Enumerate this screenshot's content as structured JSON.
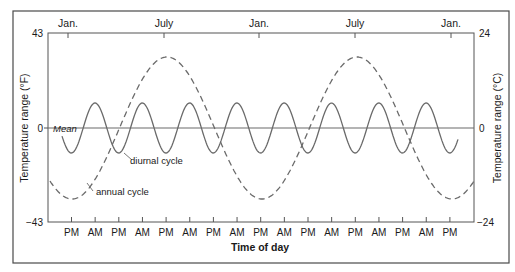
{
  "chart_data": {
    "type": "line",
    "title": "",
    "xlabel": "Time of day",
    "ylabel_left": "Temperature range (°F)",
    "ylabel_right": "Temperature range (°C)",
    "ylim_left": [
      -43,
      43
    ],
    "ylim_right": [
      -24,
      24
    ],
    "yticks_left": [
      "43",
      "0",
      "-43"
    ],
    "yticks_right": [
      "24",
      "0",
      "-24"
    ],
    "top_axis_ticks": [
      "Jan.",
      "July",
      "Jan.",
      "July",
      "Jan."
    ],
    "bottom_axis_ticks": [
      "PM",
      "AM",
      "PM",
      "AM",
      "PM",
      "AM",
      "PM",
      "AM",
      "PM",
      "AM",
      "PM",
      "AM",
      "PM",
      "AM",
      "PM",
      "AM",
      "PM"
    ],
    "mean_label": "Mean",
    "grid": false,
    "legend": "inline annotations",
    "series": [
      {
        "name": "diurnal cycle",
        "style": "solid",
        "description": "Sinusoid about the mean with period of one day (PM peaks, AM troughs), ~9 cycles shown",
        "amplitude_F": 11,
        "peaks_at": "PM",
        "troughs_at": "AM"
      },
      {
        "name": "annual cycle",
        "style": "dashed",
        "description": "Sinusoid about the mean with period of one year; minimum at Jan., maximum at July",
        "amplitude_F": 30,
        "x": [
          "Jan.",
          "July",
          "Jan.",
          "July",
          "Jan."
        ],
        "values": [
          -30,
          30,
          -30,
          30,
          -30
        ]
      }
    ],
    "annotations": [
      "Mean",
      "diurnal cycle",
      "annual cycle"
    ]
  },
  "labels": {
    "top": [
      "Jan.",
      "July",
      "Jan.",
      "July",
      "Jan."
    ],
    "bottom": [
      "PM",
      "AM",
      "PM",
      "AM",
      "PM",
      "AM",
      "PM",
      "AM",
      "PM",
      "AM",
      "PM",
      "AM",
      "PM",
      "AM",
      "PM",
      "AM",
      "PM"
    ],
    "y_left_top": "43",
    "y_left_zero": "0",
    "y_left_bottom": "−43",
    "y_right_top": "24",
    "y_right_zero": "0",
    "y_right_bottom": "−24",
    "ylabel_left": "Temperature range (°F)",
    "ylabel_right": "Temperature range (°C)",
    "xlabel": "Time of day",
    "mean": "Mean",
    "diurnal": "diurnal cycle",
    "annual": "annual cycle"
  },
  "colors": {
    "frame": "#4a4a4a",
    "axis": "#555555",
    "curve": "#6a6a6a",
    "text": "#1a1a1a"
  }
}
